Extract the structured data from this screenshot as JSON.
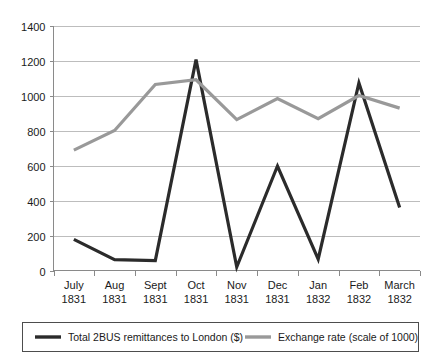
{
  "chart_data": {
    "type": "line",
    "title": "",
    "xlabel": "",
    "ylabel": "",
    "ylim": [
      0,
      1400
    ],
    "ytick_step": 200,
    "grid": true,
    "legend_position": "bottom",
    "categories": [
      "July 1831",
      "Aug 1831",
      "Sept 1831",
      "Oct 1831",
      "Nov 1831",
      "Dec 1831",
      "Jan 1832",
      "Feb 1832",
      "March 1832"
    ],
    "category_lines": [
      [
        "July",
        "1831"
      ],
      [
        "Aug",
        "1831"
      ],
      [
        "Sept",
        "1831"
      ],
      [
        "Oct",
        "1831"
      ],
      [
        "Nov",
        "1831"
      ],
      [
        "Dec",
        "1831"
      ],
      [
        "Jan",
        "1832"
      ],
      [
        "Feb",
        "1832"
      ],
      [
        "March",
        "1832"
      ]
    ],
    "yticks": [
      0,
      200,
      400,
      600,
      800,
      1000,
      1200,
      1400
    ],
    "series": [
      {
        "name": "Total 2BUS remittances to London ($)",
        "color": "#2b2b2b",
        "width": 3.2,
        "values": [
          178,
          62,
          57,
          1205,
          20,
          597,
          65,
          1072,
          360
        ]
      },
      {
        "name": "Exchange rate (scale of 1000)",
        "color": "#999999",
        "width": 3.2,
        "values": [
          688,
          800,
          1063,
          1090,
          862,
          983,
          868,
          1000,
          928
        ]
      }
    ]
  },
  "legend": {
    "entries": [
      {
        "label": "Total 2BUS remittances to London ($)",
        "color": "#2b2b2b"
      },
      {
        "label": "Exchange rate (scale of 1000)",
        "color": "#999999"
      }
    ]
  }
}
